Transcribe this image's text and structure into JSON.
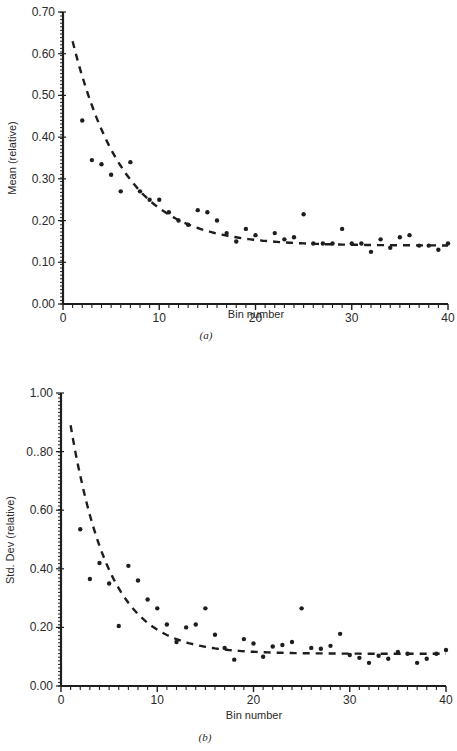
{
  "chart_data": [
    {
      "id": "a",
      "type": "scatter",
      "caption": "(a)",
      "title": "",
      "xlabel": "Bin number",
      "ylabel": "Mean (relative)",
      "xlim": [
        0,
        40
      ],
      "ylim": [
        0,
        0.7
      ],
      "xticks": [
        0,
        10,
        20,
        30,
        40
      ],
      "xtick_labels": [
        "0",
        "10",
        "20",
        "30",
        "40"
      ],
      "yticks": [
        0,
        0.1,
        0.2,
        0.3,
        0.4,
        0.5,
        0.6,
        0.7
      ],
      "ytick_labels": [
        "0.00",
        "0.10",
        "0.20",
        "0.30",
        "0.40",
        "0.50",
        "0.60",
        "0.70"
      ],
      "grid": false,
      "legend": null,
      "series": [
        {
          "name": "observed",
          "kind": "points",
          "x": [
            2,
            3,
            4,
            5,
            6,
            7,
            8,
            9,
            10,
            11,
            12,
            13,
            14,
            15,
            16,
            17,
            18,
            19,
            20,
            22,
            23,
            24,
            25,
            26,
            27,
            28,
            29,
            30,
            31,
            32,
            33,
            34,
            35,
            36,
            37,
            38,
            39,
            40
          ],
          "y": [
            0.44,
            0.345,
            0.335,
            0.31,
            0.27,
            0.34,
            0.27,
            0.25,
            0.25,
            0.22,
            0.2,
            0.19,
            0.225,
            0.22,
            0.2,
            0.17,
            0.15,
            0.18,
            0.165,
            0.17,
            0.155,
            0.16,
            0.215,
            0.145,
            0.145,
            0.145,
            0.18,
            0.145,
            0.145,
            0.125,
            0.155,
            0.135,
            0.16,
            0.165,
            0.14,
            0.14,
            0.13,
            0.145
          ]
        },
        {
          "name": "fit",
          "kind": "dashed-curve",
          "model": "exponential-decay",
          "x0": 1,
          "asymptote": 0.14,
          "amplitude": 0.49,
          "tau": 5.3,
          "x_range": [
            1,
            40
          ]
        }
      ]
    },
    {
      "id": "b",
      "type": "scatter",
      "caption": "(b)",
      "title": "",
      "xlabel": "Bin number",
      "ylabel": "Std. Dev (relative)",
      "xlim": [
        0,
        40
      ],
      "ylim": [
        0,
        1.0
      ],
      "xticks": [
        0,
        10,
        20,
        30,
        40
      ],
      "xtick_labels": [
        "0",
        "10",
        "20",
        "30",
        "40"
      ],
      "yticks": [
        0,
        0.2,
        0.4,
        0.6,
        0.8,
        1.0
      ],
      "ytick_labels": [
        "0.00",
        "0.20",
        "0.40",
        "0.60",
        "0..80",
        "1.00"
      ],
      "grid": false,
      "legend": null,
      "series": [
        {
          "name": "observed",
          "kind": "points",
          "x": [
            2,
            3,
            4,
            5,
            6,
            7,
            8,
            9,
            10,
            11,
            12,
            13,
            14,
            15,
            16,
            17,
            18,
            19,
            20,
            21,
            22,
            23,
            24,
            25,
            26,
            27,
            28,
            29,
            30,
            31,
            32,
            33,
            34,
            35,
            36,
            37,
            38,
            39,
            40
          ],
          "y": [
            0.535,
            0.365,
            0.42,
            0.35,
            0.205,
            0.41,
            0.36,
            0.295,
            0.265,
            0.21,
            0.15,
            0.2,
            0.21,
            0.265,
            0.175,
            0.13,
            0.09,
            0.16,
            0.145,
            0.1,
            0.135,
            0.14,
            0.15,
            0.265,
            0.13,
            0.127,
            0.137,
            0.178,
            0.106,
            0.096,
            0.079,
            0.103,
            0.093,
            0.116,
            0.11,
            0.079,
            0.093,
            0.11,
            0.123
          ]
        },
        {
          "name": "fit",
          "kind": "dashed-curve",
          "model": "exponential-decay",
          "x0": 1,
          "asymptote": 0.11,
          "amplitude": 0.78,
          "tau": 4.0,
          "x_range": [
            1,
            40
          ]
        }
      ]
    }
  ],
  "layout": {
    "panels": [
      {
        "x0px": 63,
        "x40px": 448,
        "y0px": 304,
        "ytopPx": 12,
        "ylabel_x": 16,
        "ylabel_y": 158,
        "xlabel_x": 256,
        "xlabel_y": 318,
        "caption_x": 206,
        "caption_y": 339
      },
      {
        "x0px": 61,
        "x40px": 446,
        "y0px": 686,
        "ytopPx": 393,
        "ylabel_x": 14,
        "ylabel_y": 540,
        "xlabel_x": 254,
        "xlabel_y": 719,
        "caption_x": 205,
        "caption_y": 741
      }
    ]
  }
}
